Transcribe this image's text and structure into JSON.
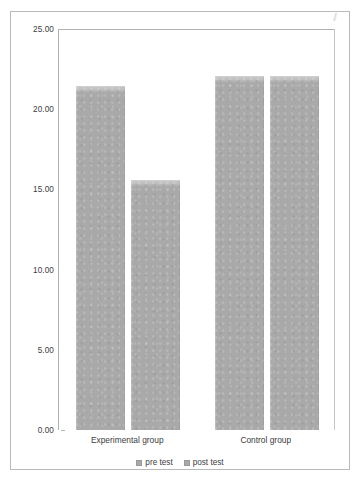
{
  "chart_data": {
    "type": "bar",
    "title": "",
    "subtitle": "",
    "xlabel": "",
    "ylabel": "",
    "categories": [
      "Experimental group",
      "Control group"
    ],
    "series": [
      {
        "name": "pre test",
        "values": [
          21.4,
          22.0
        ]
      },
      {
        "name": "post test",
        "values": [
          15.5,
          22.0
        ]
      }
    ],
    "ylim": [
      0.0,
      25.0
    ],
    "y_ticks": [
      0.0,
      5.0,
      10.0,
      15.0,
      20.0,
      25.0
    ],
    "y_tick_labels": [
      "0.00",
      "5.00",
      "10.00",
      "15.00",
      "20.00",
      "25.00"
    ],
    "grid": false,
    "legend_position": "bottom",
    "bar_color": "#a9a9a9",
    "axis_color": "#b0b0b0",
    "text_color": "#3d3d3d",
    "frame_color": "#b9b9b9"
  },
  "legend": {
    "items": [
      {
        "label": "pre test",
        "swatch": "legend-swatch-icon"
      },
      {
        "label": "post test",
        "swatch": "legend-swatch-icon"
      }
    ]
  }
}
